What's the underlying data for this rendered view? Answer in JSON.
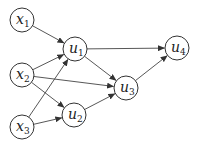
{
  "diagram": {
    "type": "directed-graph",
    "nodes": [
      {
        "id": "x1",
        "base": "x",
        "sub": "1",
        "cx": 22,
        "cy": 20
      },
      {
        "id": "x2",
        "base": "x",
        "sub": "2",
        "cx": 22,
        "cy": 75
      },
      {
        "id": "x3",
        "base": "x",
        "sub": "3",
        "cx": 22,
        "cy": 127
      },
      {
        "id": "u1",
        "base": "u",
        "sub": "1",
        "cx": 75,
        "cy": 49
      },
      {
        "id": "u2",
        "base": "u",
        "sub": "2",
        "cx": 74,
        "cy": 115
      },
      {
        "id": "u3",
        "base": "u",
        "sub": "3",
        "cx": 126,
        "cy": 88
      },
      {
        "id": "u4",
        "base": "u",
        "sub": "4",
        "cx": 177,
        "cy": 48
      }
    ],
    "edges": [
      {
        "from": "x1",
        "to": "u1"
      },
      {
        "from": "x2",
        "to": "u1"
      },
      {
        "from": "x2",
        "to": "u3"
      },
      {
        "from": "x2",
        "to": "u2"
      },
      {
        "from": "x3",
        "to": "u1"
      },
      {
        "from": "x3",
        "to": "u2"
      },
      {
        "from": "u1",
        "to": "u4"
      },
      {
        "from": "u1",
        "to": "u3"
      },
      {
        "from": "u2",
        "to": "u3"
      },
      {
        "from": "u3",
        "to": "u4"
      }
    ],
    "node_radius": 12
  }
}
